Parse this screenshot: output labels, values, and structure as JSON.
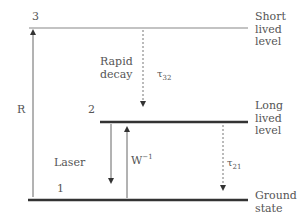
{
  "diagram": {
    "levels": [
      {
        "id": "3",
        "label": "3",
        "description": "Short\nlived\nlevel",
        "y": 28,
        "style": "thin"
      },
      {
        "id": "2",
        "label": "2",
        "description": "Long\nlived\nlevel",
        "y": 122,
        "style": "thick"
      },
      {
        "id": "1",
        "label": "1",
        "description": "Ground\nstate",
        "y": 200,
        "style": "thick"
      }
    ],
    "transitions": [
      {
        "name": "pump",
        "label": "R",
        "from": "1",
        "to": "3",
        "style": "solid",
        "direction": "up"
      },
      {
        "name": "rapid-decay",
        "label": "Rapid\ndecay",
        "tau": "τ",
        "tau_sub": "32",
        "from": "3",
        "to": "2",
        "style": "dashed",
        "direction": "down"
      },
      {
        "name": "laser",
        "label": "Laser",
        "from": "2",
        "to": "1",
        "style": "solid",
        "direction": "down"
      },
      {
        "name": "absorption",
        "label": "W",
        "label_sup": "−1",
        "from": "1",
        "to": "2",
        "style": "solid",
        "direction": "up"
      },
      {
        "name": "spontaneous-decay",
        "tau": "τ",
        "tau_sub": "21",
        "from": "2",
        "to": "1",
        "style": "dashed",
        "direction": "down"
      }
    ],
    "colors": {
      "line": "#333333",
      "thin_line": "#777777",
      "text": "#555555"
    }
  }
}
